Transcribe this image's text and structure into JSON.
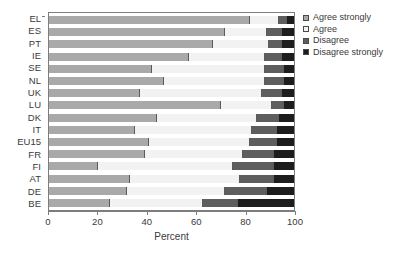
{
  "chart_data": {
    "type": "bar",
    "orientation": "horizontal",
    "stacked": true,
    "normalized": true,
    "title": "",
    "xlabel": "Percent",
    "ylabel": "",
    "xlim": [
      0,
      100
    ],
    "xticks": [
      0,
      20,
      40,
      60,
      80,
      100
    ],
    "grid": false,
    "legend_position": "right",
    "categories": [
      "EL",
      "ES",
      "PT",
      "IE",
      "SE",
      "NL",
      "UK",
      "LU",
      "DK",
      "IT",
      "EU15",
      "FR",
      "FI",
      "AT",
      "DE",
      "BE"
    ],
    "series": [
      {
        "name": "Agree strongly",
        "color": "#a9a9a9",
        "values": [
          82,
          72,
          67,
          57,
          42,
          47,
          37,
          70,
          44,
          35,
          41,
          39,
          20,
          33,
          32,
          25
        ]
      },
      {
        "name": "Agree",
        "color": "#f2f2f2",
        "values": [
          12,
          17,
          23,
          31,
          46,
          41,
          50,
          21,
          41,
          48,
          41,
          40,
          55,
          45,
          40,
          38
        ]
      },
      {
        "name": "Disagree",
        "color": "#5e5e5e",
        "values": [
          3,
          6,
          5,
          7,
          8,
          8,
          8,
          5,
          9,
          10,
          11,
          13,
          17,
          14,
          17,
          14
        ]
      },
      {
        "name": "Disagree strongly",
        "color": "#1d1d1d",
        "values": [
          3,
          5,
          5,
          5,
          4,
          4,
          5,
          4,
          6,
          7,
          7,
          8,
          8,
          8,
          11,
          23
        ]
      }
    ]
  },
  "axis": {
    "x_title": "Percent",
    "x_tick_labels": [
      "0",
      "20",
      "40",
      "60",
      "80",
      "100"
    ],
    "y_tick_labels": [
      "EL",
      "ES",
      "PT",
      "IE",
      "SE",
      "NL",
      "UK",
      "LU",
      "DK",
      "IT",
      "EU15",
      "FR",
      "FI",
      "AT",
      "DE",
      "BE"
    ]
  },
  "legend": {
    "items": [
      {
        "label": "Agree strongly",
        "color": "#a9a9a9"
      },
      {
        "label": "Agree",
        "color": "#f2f2f2"
      },
      {
        "label": "Disagree",
        "color": "#5e5e5e"
      },
      {
        "label": "Disagree strongly",
        "color": "#1d1d1d"
      }
    ]
  },
  "colors": {
    "agree_strongly": "#a9a9a9",
    "agree": "#f2f2f2",
    "disagree": "#5e5e5e",
    "disagree_strongly": "#1d1d1d",
    "axis": "#7d7d7d",
    "text": "#3a3a3a",
    "background": "#ffffff"
  }
}
